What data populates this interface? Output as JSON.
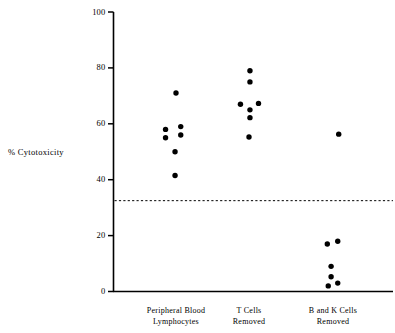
{
  "chart_data": {
    "type": "scatter",
    "title": "",
    "subtitle": "",
    "xlabel": "",
    "ylabel": "% Cytotoxicity",
    "ylim": [
      0,
      100
    ],
    "yticks": [
      0,
      20,
      40,
      60,
      80,
      100
    ],
    "ytick_labels": [
      "0",
      "20",
      "40",
      "60",
      "80",
      "100"
    ],
    "grid": false,
    "legend": null,
    "legend_position": "none",
    "categories": [
      "Peripheral Blood Lymphocytes",
      "T Cells Removed",
      "B and K Cells Removed"
    ],
    "category_labels": [
      {
        "line1": "Peripheral Blood",
        "line2": "Lymphocytes"
      },
      {
        "line1": "T Cells",
        "line2": "Removed"
      },
      {
        "line1": "B and K Cells",
        "line2": "Removed"
      }
    ],
    "annotations": [
      {
        "name": "threshold-line",
        "type": "horizontal-dashed-line",
        "value": 32.5,
        "style": "dashed",
        "color": "#000000"
      }
    ],
    "marker": {
      "shape": "circle",
      "filled": true,
      "color": "#000000",
      "size_px": 5.4
    },
    "series": [
      {
        "name": "Peripheral Blood Lymphocytes",
        "category_index": 0,
        "points": [
          {
            "x_offset": 0.0,
            "y": 71.0
          },
          {
            "x_offset": -0.55,
            "y": 58.0
          },
          {
            "x_offset": 0.25,
            "y": 59.0
          },
          {
            "x_offset": -0.55,
            "y": 55.0
          },
          {
            "x_offset": 0.25,
            "y": 56.0
          },
          {
            "x_offset": -0.05,
            "y": 50.0
          },
          {
            "x_offset": -0.05,
            "y": 41.5
          }
        ]
      },
      {
        "name": "T Cells Removed",
        "category_index": 1,
        "points": [
          {
            "x_offset": 0.05,
            "y": 79.0
          },
          {
            "x_offset": 0.05,
            "y": 75.0
          },
          {
            "x_offset": -0.45,
            "y": 67.0
          },
          {
            "x_offset": 0.5,
            "y": 67.3
          },
          {
            "x_offset": 0.05,
            "y": 65.0
          },
          {
            "x_offset": 0.05,
            "y": 62.2
          },
          {
            "x_offset": 0.0,
            "y": 55.3
          }
        ]
      },
      {
        "name": "B and K Cells Removed",
        "category_index": 2,
        "points": [
          {
            "x_offset": 0.3,
            "y": 56.3
          },
          {
            "x_offset": -0.3,
            "y": 17.0
          },
          {
            "x_offset": 0.25,
            "y": 18.0
          },
          {
            "x_offset": -0.1,
            "y": 9.0
          },
          {
            "x_offset": -0.1,
            "y": 5.3
          },
          {
            "x_offset": -0.25,
            "y": 2.0
          },
          {
            "x_offset": 0.25,
            "y": 3.0
          }
        ]
      }
    ]
  }
}
